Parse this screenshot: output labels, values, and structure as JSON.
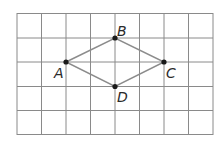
{
  "diagram": {
    "type": "grid-figure",
    "grid": {
      "columns": 8,
      "rows": 5,
      "line_color": "#8a8a8a"
    },
    "shape": {
      "name": "rhombus",
      "edges": [
        "AB",
        "BC",
        "CD",
        "DA"
      ],
      "line_color": "#8c8c8c"
    },
    "points": [
      {
        "label": "A",
        "col": 2,
        "row": 2
      },
      {
        "label": "B",
        "col": 4,
        "row": 1
      },
      {
        "label": "C",
        "col": 6,
        "row": 2
      },
      {
        "label": "D",
        "col": 4,
        "row": 3
      }
    ]
  }
}
